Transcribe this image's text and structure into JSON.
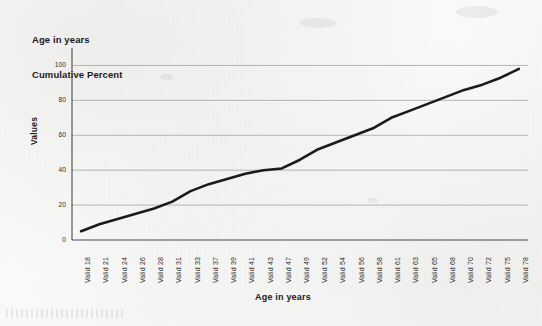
{
  "chart_data": {
    "type": "line",
    "title": "Age in years\nCumulative Percent",
    "title_line1": "Age in years",
    "title_line2": "Cumulative Percent",
    "xlabel": "Age in years",
    "ylabel": "Values",
    "ylim": [
      0,
      110
    ],
    "yticks": [
      0,
      20,
      40,
      60,
      80,
      100
    ],
    "ytick_labels": [
      "0",
      "20",
      "40",
      "60",
      "80",
      "100"
    ],
    "grid": true,
    "legend": "none",
    "line_color": "#1a1a1a",
    "line_width": 2.6,
    "categories": [
      "Valid 18",
      "Valid 21",
      "Valid 24",
      "Valid 26",
      "Valid 28",
      "Valid 31",
      "Valid 33",
      "Valid 37",
      "Valid 39",
      "Valid 41",
      "Valid 43",
      "Valid 47",
      "Valid 49",
      "Valid 52",
      "Valid 54",
      "Valid 56",
      "Valid 58",
      "Valid 61",
      "Valid 63",
      "Valid 65",
      "Valid 68",
      "Valid 70",
      "Valid 72",
      "Valid 75",
      "Valid 78"
    ],
    "x": [
      18,
      21,
      24,
      26,
      28,
      31,
      33,
      37,
      39,
      41,
      43,
      47,
      49,
      52,
      54,
      56,
      58,
      61,
      63,
      65,
      68,
      70,
      72,
      75,
      78
    ],
    "series": [
      {
        "name": "Cumulative Percent",
        "values": [
          5,
          9,
          12,
          15,
          18,
          22,
          28,
          32,
          35,
          38,
          40,
          41,
          46,
          52,
          56,
          60,
          64,
          70,
          74,
          78,
          82,
          86,
          89,
          93,
          98
        ]
      }
    ]
  },
  "axes": {
    "y_title": "Values",
    "x_title": "Age in years"
  }
}
